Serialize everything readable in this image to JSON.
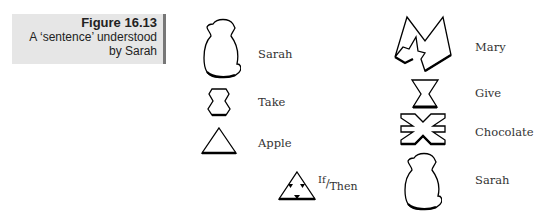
{
  "caption": {
    "figure": "Figure 16.13",
    "line1": "A ‘sentence’ understood",
    "line2": "by Sarah"
  },
  "left_column": [
    {
      "symbol": "monkey-icon",
      "label": "Sarah"
    },
    {
      "symbol": "hexagon-icon",
      "label": "Take"
    },
    {
      "symbol": "triangle-icon",
      "label": "Apple"
    }
  ],
  "if_then": {
    "symbol": "triangle-with-arrows-icon",
    "label_if": "If",
    "label_then": "Then",
    "separator": "/"
  },
  "right_column": [
    {
      "symbol": "m-shape-icon",
      "label": "Mary"
    },
    {
      "symbol": "hourglass-icon",
      "label": "Give"
    },
    {
      "symbol": "star-cross-icon",
      "label": "Chocolate"
    },
    {
      "symbol": "monkey-icon",
      "label": "Sarah"
    }
  ]
}
